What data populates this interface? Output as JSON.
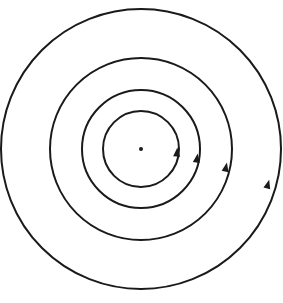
{
  "diagram": {
    "center": {
      "x": 141,
      "y": 149
    },
    "stroke_color": "#1a1a1a",
    "background": "#ffffff",
    "circles": [
      {
        "r": 38,
        "arrow": {
          "x": 177,
          "y": 152
        }
      },
      {
        "r": 59,
        "arrow": {
          "x": 197,
          "y": 158
        }
      },
      {
        "r": 91,
        "arrow": {
          "x": 226,
          "y": 167
        }
      },
      {
        "r": 140,
        "arrow": {
          "x": 268,
          "y": 184
        }
      }
    ],
    "arrow_direction": "counterclockwise"
  }
}
